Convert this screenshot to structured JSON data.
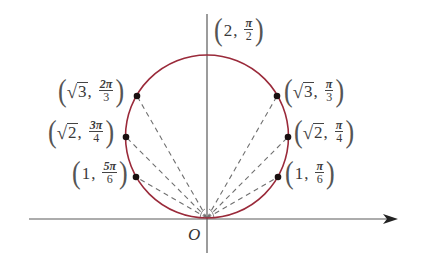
{
  "diagram": {
    "type": "polar-circle-plot",
    "colors": {
      "curve": "#9a2a3a",
      "axes": "#555555",
      "dashes": "#707070",
      "points": "#1a1010",
      "text": "#3a3a3a"
    },
    "origin_label": "O",
    "points": [
      {
        "id": "top",
        "r": "2",
        "theta": "π/2",
        "r_sqrt": false,
        "theta_num": "π",
        "theta_den": "2"
      },
      {
        "id": "sqrt3-pi3",
        "r": "3",
        "theta": "π/3",
        "r_sqrt": true,
        "theta_num": "π",
        "theta_den": "3"
      },
      {
        "id": "sqrt2-pi4",
        "r": "2",
        "theta": "π/4",
        "r_sqrt": true,
        "theta_num": "π",
        "theta_den": "4"
      },
      {
        "id": "1-pi6",
        "r": "1",
        "theta": "π/6",
        "r_sqrt": false,
        "theta_num": "π",
        "theta_den": "6"
      },
      {
        "id": "sqrt3-2pi3",
        "r": "3",
        "theta": "2π/3",
        "r_sqrt": true,
        "theta_num": "2π",
        "theta_den": "3"
      },
      {
        "id": "sqrt2-3pi4",
        "r": "2",
        "theta": "3π/4",
        "r_sqrt": true,
        "theta_num": "3π",
        "theta_den": "4"
      },
      {
        "id": "1-5pi6",
        "r": "1",
        "theta": "5π/6",
        "r_sqrt": false,
        "theta_num": "5π",
        "theta_den": "6"
      }
    ],
    "labels": {
      "top": {
        "r": "2",
        "num": "π",
        "den": "2"
      },
      "right_top": {
        "r": "3",
        "num": "π",
        "den": "3"
      },
      "right_mid": {
        "r": "2",
        "num": "π",
        "den": "4"
      },
      "right_bot": {
        "r": "1",
        "num": "π",
        "den": "6"
      },
      "left_top": {
        "r": "3",
        "num": "2π",
        "den": "3"
      },
      "left_mid": {
        "r": "2",
        "num": "3π",
        "den": "4"
      },
      "left_bot": {
        "r": "1",
        "num": "5π",
        "den": "6"
      }
    },
    "sqrt_symbol": "√",
    "open_paren": "(",
    "close_paren": ")",
    "comma": ","
  }
}
